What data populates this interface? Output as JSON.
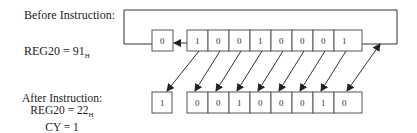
{
  "before": {
    "title": "Before Instruction:",
    "register_label": "REG20 = 91",
    "register_suffix": "H",
    "carry_bit": "0",
    "bits": [
      "1",
      "0",
      "0",
      "1",
      "0",
      "0",
      "0",
      "1"
    ]
  },
  "after": {
    "title": "After Instruction:",
    "register_label": "REG20 = 22",
    "register_suffix": "H",
    "carry_label": "CY = 1",
    "carry_bit": "1",
    "bits": [
      "0",
      "0",
      "1",
      "0",
      "0",
      "0",
      "1",
      "0"
    ]
  },
  "colors": {
    "line": "#333333",
    "box_border": "#555555"
  }
}
